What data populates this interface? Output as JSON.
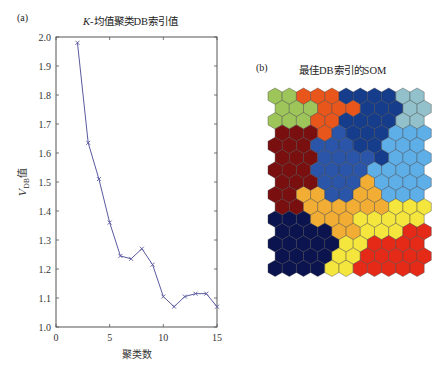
{
  "panels": {
    "a": {
      "label": "(a)",
      "title_italic": "K",
      "title_rest": "-均值聚类DB索引值"
    },
    "b": {
      "label": "(b)",
      "title": "最佳DB索引的SOM"
    }
  },
  "chart_data": [
    {
      "type": "line",
      "title": "K-均值聚类DB索引值",
      "xlabel": "聚类数",
      "ylabel": "V_DB值",
      "ylabel_main": "V",
      "ylabel_sub": "DB",
      "ylabel_suffix": "值",
      "xlim": [
        0,
        15
      ],
      "ylim": [
        1.0,
        2.0
      ],
      "xticks": [
        0,
        5,
        10,
        15
      ],
      "xtick_labels": [
        "0",
        "5",
        "10",
        "15"
      ],
      "yticks": [
        1.0,
        1.1,
        1.2,
        1.3,
        1.4,
        1.5,
        1.6,
        1.7,
        1.8,
        1.9,
        2.0
      ],
      "ytick_labels": [
        "1.0",
        "1.1",
        "1.2",
        "1.3",
        "1.4",
        "1.5",
        "1.6",
        "1.7",
        "1.8",
        "1.9",
        "2.0"
      ],
      "grid": false,
      "series": [
        {
          "name": "DB index",
          "color": "#5a5aa0",
          "marker": "x",
          "x": [
            2,
            3,
            4,
            5,
            6,
            7,
            8,
            9,
            10,
            11,
            12,
            13,
            14,
            15
          ],
          "y": [
            1.98,
            1.635,
            1.51,
            1.36,
            1.245,
            1.235,
            1.27,
            1.215,
            1.105,
            1.07,
            1.105,
            1.115,
            1.115,
            1.07
          ]
        }
      ]
    },
    {
      "type": "heatmap",
      "title": "最佳DB索引的SOM",
      "grid_shape": "hexagonal",
      "rows": 15,
      "cols": 11,
      "cluster_colors": {
        "G": "#9dc55a",
        "O": "#e8561c",
        "N": "#163c8c",
        "T": "#92c1cb",
        "R": "#7a0f10",
        "B": "#2a55a8",
        "L": "#5eaee8",
        "A": "#f2ae34",
        "Y": "#f4e63c",
        "D": "#0c1450",
        "E": "#e62a18"
      },
      "cells": [
        "GGOOONNNNTT",
        "GGGOOONNNTT",
        "GGGOONNNNTT",
        "RRROBNNNLLL",
        "RRRBBBNNLLL",
        "RRRBBBBNLLL",
        "RRRBBBBLLLL",
        "RRRBBBALLLL",
        "RRAABBAALLL",
        "RRAAAAAAYYY",
        "DDDAAAYYYYY",
        "DDDDAAYYYEE",
        "DDDDDYYEEEE",
        "DDDDYYEEEEE",
        "DDDDYYEEEEE"
      ]
    }
  ]
}
